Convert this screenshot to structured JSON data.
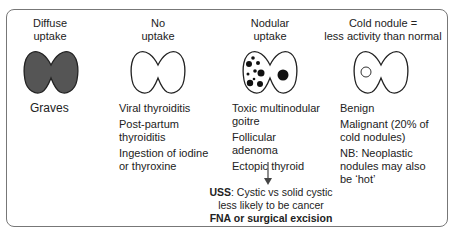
{
  "columns": [
    {
      "header": [
        "Diffuse",
        "uptake"
      ],
      "gland_style": "filled",
      "causes": [
        "Graves"
      ]
    },
    {
      "header": [
        "No",
        "uptake"
      ],
      "gland_style": "empty",
      "causes": [
        "Viral thyroiditis",
        "Post-partum thyroiditis",
        "Ingestion of iodine or thyroxine"
      ]
    },
    {
      "header": [
        "Nodular",
        "uptake"
      ],
      "gland_style": "nodular-dots",
      "causes": [
        "Toxic multinodular goitre",
        "Follicular adenoma",
        "Ectopic thyroid"
      ]
    },
    {
      "header": [
        "Cold nodule =",
        "less activity than normal"
      ],
      "gland_style": "cold-nodule",
      "causes": [
        "Benign",
        "Malignant (20% of cold nodules)",
        "NB: Neoplastic nodules may also be ‘hot’"
      ]
    }
  ],
  "uss_note": {
    "label": "USS",
    "line1": ": Cystic vs solid cystic",
    "line2": "less likely to be cancer",
    "line3": "FNA or surgical excision"
  },
  "colors": {
    "gland_fill": "#555555",
    "outline": "#222222",
    "frame": "#777777"
  }
}
